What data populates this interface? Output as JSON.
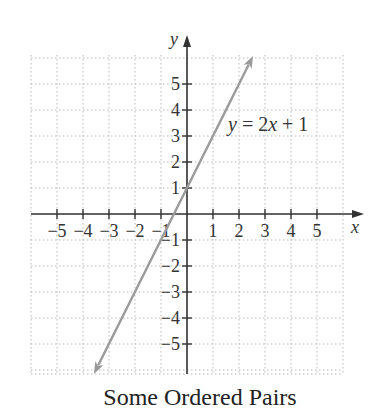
{
  "chart_data": {
    "type": "line",
    "title": "Some Ordered Pairs",
    "xlabel": "x",
    "ylabel": "y",
    "xlim": [
      -6,
      6
    ],
    "ylim": [
      -6.2,
      6
    ],
    "grid": true,
    "grid_style": "dotted",
    "x_ticks": [
      -5,
      -4,
      -3,
      -2,
      -1,
      1,
      2,
      3,
      4,
      5
    ],
    "y_ticks": [
      -5,
      -4,
      -3,
      -2,
      -1,
      1,
      2,
      3,
      4,
      5
    ],
    "series": [
      {
        "name": "y = 2x + 1",
        "equation": "y = 2x + 1",
        "slope": 2,
        "intercept": 1,
        "color": "#9a9a9a",
        "arrows": "both",
        "x": [
          -3.58,
          2.54
        ],
        "y": [
          -6.15,
          6.08
        ]
      }
    ],
    "annotations": [
      {
        "text": "y = 2x + 1",
        "x": 1.6,
        "y": 3.2
      }
    ]
  },
  "labels": {
    "title": "Some Ordered Pairs",
    "x_axis": "x",
    "y_axis": "y",
    "equation_y": "y",
    "equation_mid": " = 2",
    "equation_x": "x",
    "equation_end": " + 1"
  },
  "colors": {
    "axis": "#333333",
    "grid": "#b8b8b8",
    "line": "#9a9a9a",
    "text": "#333333"
  }
}
